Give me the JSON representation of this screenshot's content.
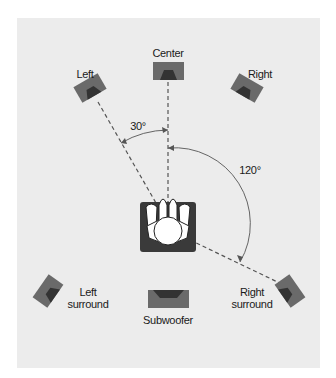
{
  "speakers": {
    "center": "Center",
    "left": "Left",
    "right": "Right",
    "left_surround": [
      "Left",
      "surround"
    ],
    "right_surround": [
      "Right",
      "surround"
    ],
    "subwoofer": "Subwoofer"
  },
  "angles": {
    "front": "30°",
    "surround": "120°"
  },
  "colors": {
    "background": "#ececec",
    "speaker_body": "#6a6a6a",
    "speaker_cone": "#333333",
    "guide_line": "#555555"
  }
}
